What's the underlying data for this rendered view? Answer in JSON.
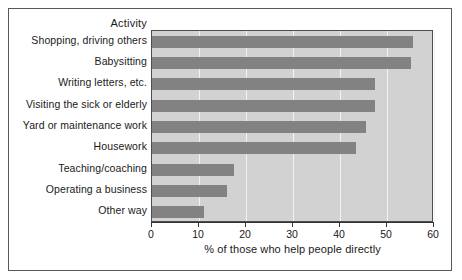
{
  "figure": {
    "background_color": "#ffffff",
    "frame_color": "#595959",
    "plot_background_color": "#d2d2d2",
    "gridline_color": "#f2f2f2",
    "bar_color": "#828282",
    "axis_color": "#333333",
    "category_axis_header": "Activity"
  },
  "chart_data": {
    "type": "bar",
    "orientation": "horizontal",
    "title": "",
    "xlabel": "% of those who help people directly",
    "ylabel": "Activity",
    "xlim": [
      0,
      60
    ],
    "xticks": [
      0,
      10,
      20,
      30,
      40,
      50,
      60
    ],
    "xtick_labels": [
      "0",
      "10",
      "20",
      "30",
      "40",
      "50",
      "60"
    ],
    "grid": true,
    "grid_axis": "x",
    "legend": false,
    "categories": [
      "Shopping, driving others",
      "Babysitting",
      "Writing letters, etc.",
      "Visiting the sick or elderly",
      "Yard or maintenance work",
      "Housework",
      "Teaching/coaching",
      "Operating a business",
      "Other way"
    ],
    "values": [
      55.5,
      55,
      47.5,
      47.5,
      45.5,
      43.5,
      17.5,
      16,
      11
    ]
  }
}
